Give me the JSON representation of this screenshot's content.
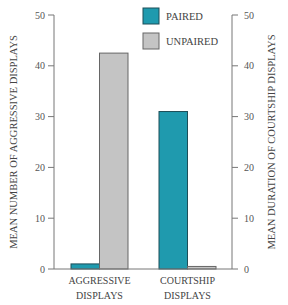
{
  "chart_data": {
    "type": "bar",
    "title": "",
    "categories": [
      [
        "AGGRESSIVE",
        "DISPLAYS"
      ],
      [
        "COURTSHIP",
        "DISPLAYS"
      ]
    ],
    "series": [
      {
        "name": "PAIRED",
        "color": "#1f9aae",
        "values": [
          1,
          31
        ]
      },
      {
        "name": "UNPAIRED",
        "color": "#c4c4c4",
        "values": [
          42.5,
          0.5
        ]
      }
    ],
    "ylabel_left": "MEAN NUMBER OF AGGRESSIVE DISPLAYS",
    "ylabel_right": "MEAN DURATION OF COURTSHIP DISPLAYS",
    "ylim_left": [
      0,
      50
    ],
    "ylim_right": [
      0,
      50
    ],
    "yticks_left": [
      0,
      10,
      20,
      30,
      40,
      50
    ],
    "yticks_right": [
      0,
      10,
      20,
      30,
      40,
      50
    ],
    "grid": false,
    "legend_position": "top-center"
  }
}
